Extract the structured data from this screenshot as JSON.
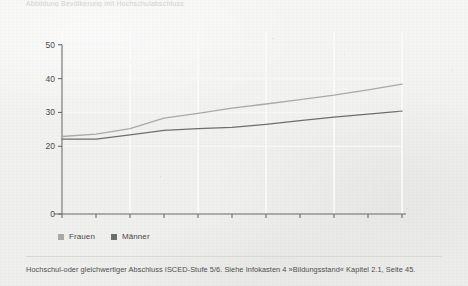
{
  "figure": {
    "cropped_header_text": "Abbildung  Bevölkerung mit Hochschulabschluss",
    "caption": "Hochschul-oder gleichwertiger Abschluss ISCED-Stufe 5/6. Siehe Infokasten 4 »Bildungsstand« Kapitel 2.1, Seite 45."
  },
  "legend": {
    "items": [
      {
        "label": "Frauen",
        "color": "#a9a9a9"
      },
      {
        "label": "Männer",
        "color": "#6e6e6e"
      }
    ]
  },
  "colors": {
    "axis": "#6b6b6b",
    "gridline": "#fbfbfa",
    "frauen": "#a9a9a9",
    "maenner": "#6e6e6e",
    "tick_text": "#4a4a4a",
    "caption_text": "#4e4e4e"
  },
  "chart_data": {
    "type": "line",
    "title": "",
    "subtitle": "",
    "xlabel": "",
    "ylabel": "",
    "x": [
      2001,
      2002,
      2003,
      2004,
      2005,
      2006,
      2007,
      2008,
      2009,
      2010,
      2011
    ],
    "xlim": [
      2001,
      2011
    ],
    "ylim": [
      0,
      52
    ],
    "ytick_values": [
      0,
      20,
      30,
      40,
      50
    ],
    "ytick_labels": [
      "0",
      "20",
      "30",
      "40",
      "50"
    ],
    "xtick_values": [
      2001,
      2002,
      2003,
      2004,
      2005,
      2006,
      2007,
      2008,
      2009,
      2010,
      2011
    ],
    "xtick_labels": [
      "2001",
      "",
      "2003",
      "",
      "2005",
      "",
      "2007",
      "",
      "2009",
      "",
      "2011"
    ],
    "grid": "vertical",
    "legend_position": "below-left",
    "series": [
      {
        "name": "Frauen",
        "color": "#a9a9a9",
        "values": [
          22.9,
          23.6,
          25.2,
          28.3,
          29.7,
          31.3,
          32.5,
          33.8,
          35.1,
          36.7,
          38.4
        ]
      },
      {
        "name": "Männer",
        "color": "#6e6e6e",
        "values": [
          22.1,
          22.1,
          23.4,
          24.7,
          25.2,
          25.6,
          26.5,
          27.6,
          28.6,
          29.5,
          30.4
        ]
      }
    ]
  }
}
